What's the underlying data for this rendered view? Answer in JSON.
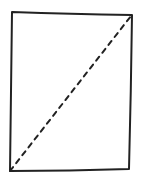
{
  "diagram": {
    "stroke_color": "#222222",
    "background": "#ffffff",
    "rectangle": {
      "points": [
        [
          12,
          12
        ],
        [
          132,
          15
        ],
        [
          129,
          169
        ],
        [
          10,
          171
        ]
      ]
    },
    "diagonal": {
      "from": [
        10,
        171
      ],
      "to": [
        131,
        16
      ],
      "style": "dashed"
    }
  }
}
